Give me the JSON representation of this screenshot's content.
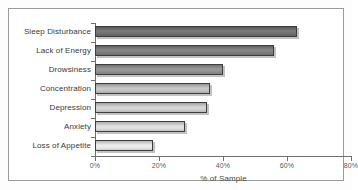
{
  "chart_data": {
    "type": "bar",
    "orientation": "horizontal",
    "title": "",
    "xlabel": "% of Sample",
    "ylabel": "",
    "categories": [
      "Sleep Disturbance",
      "Lack of Energy",
      "Drowsiness",
      "Concentration",
      "Depression",
      "Anxiety",
      "Loss of Appetite"
    ],
    "values": [
      63,
      56,
      40,
      36,
      35,
      28,
      18
    ],
    "xlim": [
      0,
      80
    ],
    "xticks": [
      0,
      20,
      40,
      60,
      80
    ],
    "xticklabels": [
      "0%",
      "20%",
      "40%",
      "60%",
      "80%"
    ],
    "grid": false,
    "legend": false,
    "bar_colors": [
      "#6e6e6e",
      "#7b7b7b",
      "#8f8f8f",
      "#c3c3c3",
      "#d2d2d2",
      "#dedede",
      "#ebebeb"
    ],
    "bar_edge_color": "#3d3d3d"
  }
}
